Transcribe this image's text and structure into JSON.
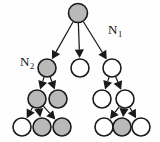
{
  "diagram": {
    "background_color": "#fefefe",
    "node_fill_shaded": "#b9b9b9",
    "node_fill_empty": "#ffffff",
    "node_stroke": "#1a1a1a",
    "edge_color": "#1a1a1a",
    "labels": [
      {
        "id": "label-n1",
        "text": "N",
        "subscript": "1",
        "x": 108,
        "y": 34
      },
      {
        "id": "label-n2",
        "text": "N",
        "subscript": "2",
        "x": 20,
        "y": 66
      }
    ],
    "nodes": [
      {
        "id": "root",
        "level": 1,
        "cx": 78,
        "cy": 13,
        "r": 9.5,
        "state": "shaded",
        "label": "N1"
      },
      {
        "id": "l2-a",
        "level": 2,
        "cx": 47,
        "cy": 68,
        "r": 9.0,
        "state": "shaded",
        "label": "N2"
      },
      {
        "id": "l2-b",
        "level": 2,
        "cx": 80,
        "cy": 68,
        "r": 9.0,
        "state": "empty",
        "label": ""
      },
      {
        "id": "l2-c",
        "level": 2,
        "cx": 112,
        "cy": 68,
        "r": 9.0,
        "state": "empty",
        "label": ""
      },
      {
        "id": "l3-a",
        "level": 3,
        "cx": 37,
        "cy": 99,
        "r": 9.0,
        "state": "shaded",
        "label": ""
      },
      {
        "id": "l3-b",
        "level": 3,
        "cx": 58,
        "cy": 99,
        "r": 9.0,
        "state": "shaded",
        "label": ""
      },
      {
        "id": "l3-c",
        "level": 3,
        "cx": 102,
        "cy": 99,
        "r": 9.0,
        "state": "empty",
        "label": ""
      },
      {
        "id": "l3-d",
        "level": 3,
        "cx": 125,
        "cy": 99,
        "r": 9.0,
        "state": "empty",
        "label": ""
      },
      {
        "id": "l4-a",
        "level": 4,
        "cx": 22,
        "cy": 127,
        "r": 9.0,
        "state": "empty",
        "label": ""
      },
      {
        "id": "l4-b",
        "level": 4,
        "cx": 42,
        "cy": 127,
        "r": 9.0,
        "state": "shaded",
        "label": ""
      },
      {
        "id": "l4-c",
        "level": 4,
        "cx": 62,
        "cy": 127,
        "r": 9.0,
        "state": "shaded",
        "label": ""
      },
      {
        "id": "l4-d",
        "level": 4,
        "cx": 104,
        "cy": 127,
        "r": 9.0,
        "state": "empty",
        "label": ""
      },
      {
        "id": "l4-e",
        "level": 4,
        "cx": 122,
        "cy": 127,
        "r": 9.0,
        "state": "shaded",
        "label": ""
      },
      {
        "id": "l4-f",
        "level": 4,
        "cx": 141,
        "cy": 127,
        "r": 9.0,
        "state": "empty",
        "label": ""
      }
    ],
    "edges": [
      {
        "id": "e-root-l2a",
        "from": "root",
        "to": "l2-a",
        "arrow": true
      },
      {
        "id": "e-root-l2b",
        "from": "root",
        "to": "l2-b",
        "arrow": true
      },
      {
        "id": "e-root-l2c",
        "from": "root",
        "to": "l2-c",
        "arrow": true
      },
      {
        "id": "e-l2a-l3a",
        "from": "l2-a",
        "to": "l3-a",
        "arrow": true
      },
      {
        "id": "e-l2a-l3b",
        "from": "l2-a",
        "to": "l3-b",
        "arrow": true
      },
      {
        "id": "e-l2c-l3c",
        "from": "l2-c",
        "to": "l3-c",
        "arrow": true
      },
      {
        "id": "e-l2c-l3d",
        "from": "l2-c",
        "to": "l3-d",
        "arrow": true
      },
      {
        "id": "e-l3a-l4a",
        "from": "l3-a",
        "to": "l4-a",
        "arrow": true
      },
      {
        "id": "e-l3a-l4b",
        "from": "l3-a",
        "to": "l4-b",
        "arrow": true
      },
      {
        "id": "e-l3a-l4c",
        "from": "l3-a",
        "to": "l4-c",
        "arrow": true
      },
      {
        "id": "e-l3d-l4d",
        "from": "l3-d",
        "to": "l4-d",
        "arrow": true
      },
      {
        "id": "e-l3d-l4e",
        "from": "l3-d",
        "to": "l4-e",
        "arrow": true
      },
      {
        "id": "e-l3d-l4f",
        "from": "l3-d",
        "to": "l4-f",
        "arrow": true
      }
    ]
  }
}
